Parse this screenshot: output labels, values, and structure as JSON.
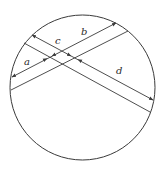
{
  "diagram": {
    "type": "geometry",
    "width": 164,
    "height": 169,
    "colors": {
      "stroke": "#3a3a3a",
      "background": "#ffffff",
      "label": "#2a2a2a"
    },
    "circle": {
      "cx": 82.5,
      "cy": 87.5,
      "r": 72.5
    },
    "chords": [
      {
        "id": "descending-upper",
        "x1": 32,
        "y1": 35,
        "x2": 153,
        "y2": 100
      },
      {
        "id": "descending-lower",
        "x1": 24,
        "y1": 43,
        "x2": 150,
        "y2": 112
      },
      {
        "id": "ascending-upper",
        "x1": 12,
        "y1": 77,
        "x2": 116,
        "y2": 23
      },
      {
        "id": "ascending-lower",
        "x1": 11,
        "y1": 90,
        "x2": 128,
        "y2": 31
      }
    ],
    "dimensions": [
      {
        "label": "a",
        "x1": 12,
        "y1": 77,
        "x2": 47,
        "y2": 58.5
      },
      {
        "label": "b",
        "x1": 52,
        "y1": 56,
        "x2": 116,
        "y2": 23
      },
      {
        "label": "c",
        "x1": 32,
        "y1": 35,
        "x2": 71,
        "y2": 56
      },
      {
        "label": "d",
        "x1": 78,
        "y1": 59.5,
        "x2": 153,
        "y2": 100
      }
    ],
    "labels": [
      {
        "text": "a",
        "x": 24,
        "y": 65
      },
      {
        "text": "b",
        "x": 81,
        "y": 35
      },
      {
        "text": "c",
        "x": 55,
        "y": 44
      },
      {
        "text": "d",
        "x": 116,
        "y": 74
      }
    ]
  }
}
